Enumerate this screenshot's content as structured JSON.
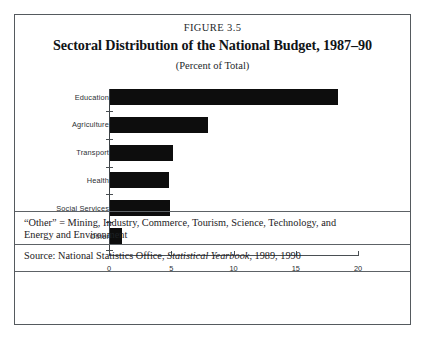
{
  "figure": {
    "number": "FIGURE 3.5",
    "title": "Sectoral Distribution of the National Budget, 1987–90",
    "subtitle": "(Percent of Total)"
  },
  "notes": {
    "other_definition_line1": "“Other” = Mining, Industry, Commerce, Tourism, Science, Technology, and",
    "other_definition_line2": "Energy and Environment",
    "source_prefix": "Source: National Statistics Office, ",
    "source_italic": "Statistical Yearbook",
    "source_suffix": ", 1989, 1990"
  },
  "chart_data": {
    "type": "bar",
    "orientation": "horizontal",
    "title": "Sectoral Distribution of the National Budget, 1987–90",
    "subtitle": "(Percent of Total)",
    "xlabel": "",
    "ylabel": "",
    "xlim": [
      0,
      20
    ],
    "xticks": [
      "0",
      "5",
      "10",
      "15",
      "20"
    ],
    "xtick_values": [
      0,
      5,
      10,
      15,
      20
    ],
    "grid": false,
    "legend": false,
    "bar_color": "#0d0d0d",
    "categories": [
      "Education",
      "Agriculture",
      "Transport",
      "Health",
      "Social  Services",
      "Other"
    ],
    "values": [
      18.3,
      7.9,
      5.1,
      4.7,
      4.8,
      1.0
    ]
  }
}
